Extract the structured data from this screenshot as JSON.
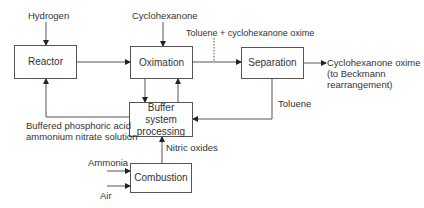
{
  "diagram": {
    "type": "process-flow",
    "nodes": {
      "reactor": "Reactor",
      "oximation": "Oximation",
      "separation": "Separation",
      "buffer": "Buffer system processing",
      "combustion": "Combustion"
    },
    "inputs": {
      "hydrogen": "Hydrogen",
      "cyclohexanone": "Cyclohexanone",
      "ammonia": "Ammonia",
      "air": "Air"
    },
    "streams": {
      "toluene_oxime": "Toluene + cyclohexanone oxime",
      "toluene": "Toluene",
      "nitric_oxides": "Nitric oxides",
      "buffered_line1": "Buffered phosphoric acid",
      "buffered_line2": "ammonium nitrate solution"
    },
    "output": {
      "line1": "Cyclohexanone oxime",
      "line2": "(to Beckmann",
      "line3": "rearrangement)"
    },
    "edges": [
      {
        "from": "Hydrogen",
        "to": "Reactor"
      },
      {
        "from": "Cyclohexanone",
        "to": "Oximation"
      },
      {
        "from": "Reactor",
        "to": "Oximation"
      },
      {
        "from": "Oximation",
        "to": "Separation",
        "label": "Toluene + cyclohexanone oxime"
      },
      {
        "from": "Separation",
        "to": "Cyclohexanone oxime (to Beckmann rearrangement)"
      },
      {
        "from": "Separation",
        "to": "Buffer system processing",
        "label": "Toluene"
      },
      {
        "from": "Oximation",
        "to": "Buffer system processing"
      },
      {
        "from": "Buffer system processing",
        "to": "Oximation"
      },
      {
        "from": "Buffer system processing",
        "to": "Reactor",
        "label": "Buffered phosphoric acid ammonium nitrate solution"
      },
      {
        "from": "Combustion",
        "to": "Buffer system processing",
        "label": "Nitric oxides"
      },
      {
        "from": "Ammonia",
        "to": "Combustion"
      },
      {
        "from": "Air",
        "to": "Combustion"
      }
    ],
    "colors": {
      "line": "#444444",
      "text": "#333333",
      "background": "#ffffff"
    }
  }
}
